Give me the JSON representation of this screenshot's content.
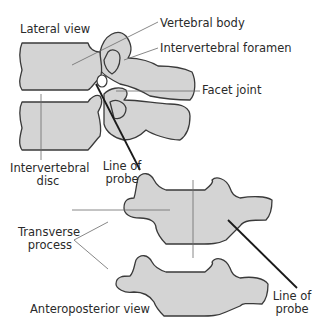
{
  "diagram": {
    "views": {
      "lateral": "Lateral view",
      "anteroposterior": "Anteroposterior view"
    },
    "labels": {
      "vertebral_body": "Vertebral body",
      "intervertebral_foramen": "Intervertebral foramen",
      "facet_joint": "Facet joint",
      "intervertebral_disc_line1": "Intervertebral",
      "intervertebral_disc_line2": "disc",
      "line_of_probe_lateral_line1": "Line of",
      "line_of_probe_lateral_line2": "probe",
      "transverse_process_line1": "Transverse",
      "transverse_process_line2": "process",
      "line_of_probe_ap_line1": "Line of",
      "line_of_probe_ap_line2": "probe"
    },
    "colors": {
      "bone_fill": "#d4d4d4",
      "outline": "#3a3a3a",
      "leader": "#6a6a6a",
      "probe": "#1a1a1a",
      "text": "#2a2a2a"
    }
  }
}
